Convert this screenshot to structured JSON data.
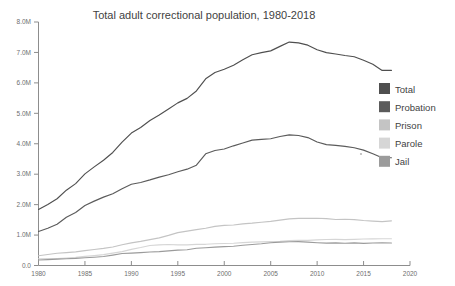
{
  "chart_data": {
    "type": "line",
    "title": "Total adult correctional population, 1980-2018",
    "xlabel": "",
    "ylabel": "",
    "xlim": [
      1980,
      2020
    ],
    "ylim": [
      0,
      8000000
    ],
    "grid": false,
    "legend_position": "right",
    "x_ticks": [
      1980,
      1985,
      1990,
      1995,
      2000,
      2005,
      2010,
      2015,
      2020
    ],
    "x_tick_labels": [
      "1980",
      "1985",
      "1990",
      "1995",
      "2000",
      "2005",
      "2010",
      "2015",
      "2020"
    ],
    "y_ticks": [
      0,
      1000000,
      2000000,
      3000000,
      4000000,
      5000000,
      6000000,
      7000000,
      8000000
    ],
    "y_tick_labels": [
      "0.0",
      "1.0M",
      "2.0M",
      "3.0M",
      "4.0M",
      "5.0M",
      "6.0M",
      "7.0M",
      "8.0M"
    ],
    "x": [
      1980,
      1981,
      1982,
      1983,
      1984,
      1985,
      1986,
      1987,
      1988,
      1989,
      1990,
      1991,
      1992,
      1993,
      1994,
      1995,
      1996,
      1997,
      1998,
      1999,
      2000,
      2001,
      2002,
      2003,
      2004,
      2005,
      2006,
      2007,
      2008,
      2009,
      2010,
      2011,
      2012,
      2013,
      2014,
      2015,
      2016,
      2017,
      2018
    ],
    "series": [
      {
        "name": "Total",
        "color": "#4f4f4f",
        "values": [
          1840400,
          2006600,
          2192600,
          2475100,
          2689200,
          3011500,
          3239400,
          3459600,
          3714100,
          4055100,
          4350300,
          4536200,
          4762600,
          4944000,
          5141300,
          5342900,
          5490700,
          5734900,
          6134200,
          6340800,
          6445100,
          6581700,
          6758800,
          6924500,
          6995100,
          7051900,
          7199600,
          7339600,
          7312600,
          7239100,
          7089000,
          6994500,
          6949800,
          6899700,
          6856900,
          6741400,
          6613500,
          6410000,
          6410000
        ]
      },
      {
        "name": "Probation",
        "color": "#5b5b5b",
        "values": [
          1118100,
          1225000,
          1357300,
          1582900,
          1740900,
          1968700,
          2114600,
          2247200,
          2356500,
          2522100,
          2670200,
          2728500,
          2811600,
          2903000,
          2981000,
          3077900,
          3164900,
          3296500,
          3670600,
          3779900,
          3826200,
          3931700,
          4024200,
          4120000,
          4143900,
          4162500,
          4236800,
          4293000,
          4271200,
          4203000,
          4055500,
          3971300,
          3944900,
          3912900,
          3868400,
          3789800,
          3673100,
          3540200,
          3540200
        ]
      },
      {
        "name": "Prison",
        "color": "#c4c4c4",
        "values": [
          319600,
          360000,
          402900,
          423900,
          448300,
          487600,
          526400,
          562800,
          607800,
          683400,
          743400,
          792500,
          850600,
          909400,
          990100,
          1078500,
          1127500,
          1176600,
          1224500,
          1287200,
          1316300,
          1330000,
          1367500,
          1390300,
          1421300,
          1448300,
          1492000,
          1532900,
          1547700,
          1549600,
          1552700,
          1538800,
          1512400,
          1520400,
          1508600,
          1476800,
          1458200,
          1439800,
          1465200
        ]
      },
      {
        "name": "Parole",
        "color": "#d6d6d6",
        "values": [
          220400,
          225500,
          224600,
          246400,
          266900,
          300200,
          325600,
          355500,
          407900,
          456800,
          531400,
          590400,
          658600,
          676100,
          690400,
          679400,
          679700,
          694800,
          696400,
          714600,
          723900,
          732300,
          750900,
          769900,
          775600,
          784400,
          798200,
          821200,
          828200,
          824600,
          840700,
          855500,
          858400,
          849500,
          857700,
          870500,
          874800,
          878200,
          878000
        ]
      },
      {
        "name": "Jail",
        "color": "#9b9b9b",
        "values": [
          182300,
          195100,
          207900,
          221800,
          233000,
          254900,
          272700,
          294000,
          341900,
          393300,
          405300,
          424100,
          441800,
          455500,
          479700,
          507000,
          518500,
          567000,
          584400,
          605900,
          621100,
          631200,
          665500,
          691300,
          713900,
          747500,
          765800,
          780200,
          785500,
          767400,
          748700,
          735600,
          744500,
          731200,
          744600,
          728200,
          740700,
          745200,
          738400
        ]
      }
    ]
  },
  "legend": {
    "items": [
      {
        "label": "Total"
      },
      {
        "label": "Probation"
      },
      {
        "label": "Prison"
      },
      {
        "label": "Parole"
      },
      {
        "label": "Jail"
      }
    ]
  }
}
